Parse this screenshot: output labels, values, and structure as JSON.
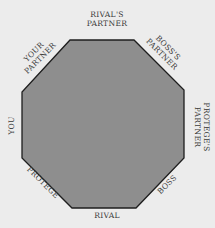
{
  "diagram": {
    "shape": "octagon",
    "fill_color": "#8e8e8e",
    "stroke_color": "#1e1e1e",
    "background_color": "#ececec",
    "labels": {
      "top": [
        "RIVAL'S",
        "PARTNER"
      ],
      "top_right": [
        "BOSS'S",
        "PARTNER"
      ],
      "right": [
        "PROTEGE'S",
        "PARTNER"
      ],
      "bottom_right": [
        "BOSS"
      ],
      "bottom": [
        "RIVAL"
      ],
      "bottom_left": [
        "PROTEGE"
      ],
      "left": [
        "YOU"
      ],
      "top_left": [
        "YOUR",
        "PARTNER"
      ]
    }
  }
}
